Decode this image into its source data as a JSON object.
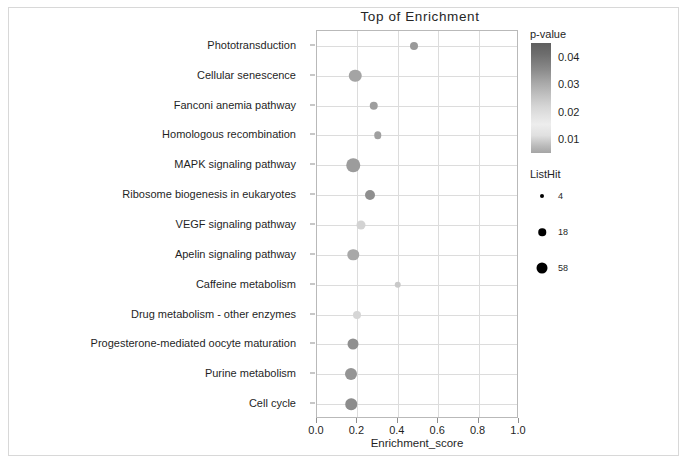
{
  "chart_data": {
    "type": "scatter",
    "title": "Top  of  Enrichment",
    "xlabel": "Enrichment_score",
    "ylabel": "",
    "xlim": [
      0.0,
      1.0
    ],
    "grid": true,
    "legend_position": "right",
    "xticks": [
      "0.0",
      "0.2",
      "0.4",
      "0.6",
      "0.8",
      "1.0"
    ],
    "xtick_values": [
      0.0,
      0.2,
      0.4,
      0.6,
      0.8,
      1.0
    ],
    "categories": [
      "Phototransduction",
      "Cellular senescence",
      "Fanconi anemia pathway",
      "Homologous recombination",
      "MAPK signaling pathway",
      "Ribosome biogenesis in eukaryotes",
      "VEGF signaling pathway",
      "Apelin signaling pathway",
      "Caffeine metabolism",
      "Drug metabolism - other enzymes",
      "Progesterone-mediated oocyte maturation",
      "Purine metabolism",
      "Cell cycle"
    ],
    "points": [
      {
        "label": "Phototransduction",
        "x": 0.48,
        "p_value": 0.028,
        "list_hit": 6,
        "size": 8.0,
        "color": "#9a9a9a"
      },
      {
        "label": "Cellular senescence",
        "x": 0.19,
        "p_value": 0.03,
        "list_hit": 30,
        "size": 12.5,
        "color": "#a4a4a4"
      },
      {
        "label": "Fanconi anemia pathway",
        "x": 0.28,
        "p_value": 0.026,
        "list_hit": 7,
        "size": 8.5,
        "color": "#9e9e9e"
      },
      {
        "label": "Homologous recombination",
        "x": 0.3,
        "p_value": 0.024,
        "list_hit": 5,
        "size": 7.5,
        "color": "#a0a0a0"
      },
      {
        "label": "MAPK signaling pathway",
        "x": 0.18,
        "p_value": 0.032,
        "list_hit": 40,
        "size": 13.5,
        "color": "#9c9c9c"
      },
      {
        "label": "Ribosome biogenesis in eukaryotes",
        "x": 0.26,
        "p_value": 0.02,
        "list_hit": 16,
        "size": 10.0,
        "color": "#8f8f8f"
      },
      {
        "label": "VEGF signaling pathway",
        "x": 0.22,
        "p_value": 0.012,
        "list_hit": 10,
        "size": 9.0,
        "color": "#d3d3d3"
      },
      {
        "label": "Apelin signaling pathway",
        "x": 0.18,
        "p_value": 0.021,
        "list_hit": 28,
        "size": 11.5,
        "color": "#a8a8a8"
      },
      {
        "label": "Caffeine metabolism",
        "x": 0.4,
        "p_value": 0.01,
        "list_hit": 4,
        "size": 6.5,
        "color": "#c9c9c9"
      },
      {
        "label": "Drug metabolism - other enzymes",
        "x": 0.2,
        "p_value": 0.011,
        "list_hit": 8,
        "size": 8.0,
        "color": "#d6d6d6"
      },
      {
        "label": "Progesterone-mediated oocyte maturation",
        "x": 0.18,
        "p_value": 0.022,
        "list_hit": 26,
        "size": 11.0,
        "color": "#8f8f8f"
      },
      {
        "label": "Purine metabolism",
        "x": 0.17,
        "p_value": 0.023,
        "list_hit": 32,
        "size": 12.0,
        "color": "#949494"
      },
      {
        "label": "Cell cycle",
        "x": 0.17,
        "p_value": 0.025,
        "list_hit": 30,
        "size": 11.5,
        "color": "#8c8c8c"
      }
    ],
    "color_legend": {
      "title": "p-value",
      "ticks": [
        "0.04",
        "0.03",
        "0.02",
        "0.01"
      ],
      "tick_values": [
        0.04,
        0.03,
        0.02,
        0.01
      ],
      "scale_min": 0.005,
      "scale_max": 0.045,
      "colormap": "grayscale"
    },
    "size_legend": {
      "title": "ListHit",
      "entries": [
        {
          "label": "4",
          "value": 4,
          "dot_px": 4.0
        },
        {
          "label": "18",
          "value": 18,
          "dot_px": 7.5
        },
        {
          "label": "58",
          "value": 58,
          "dot_px": 11.0
        }
      ]
    }
  }
}
